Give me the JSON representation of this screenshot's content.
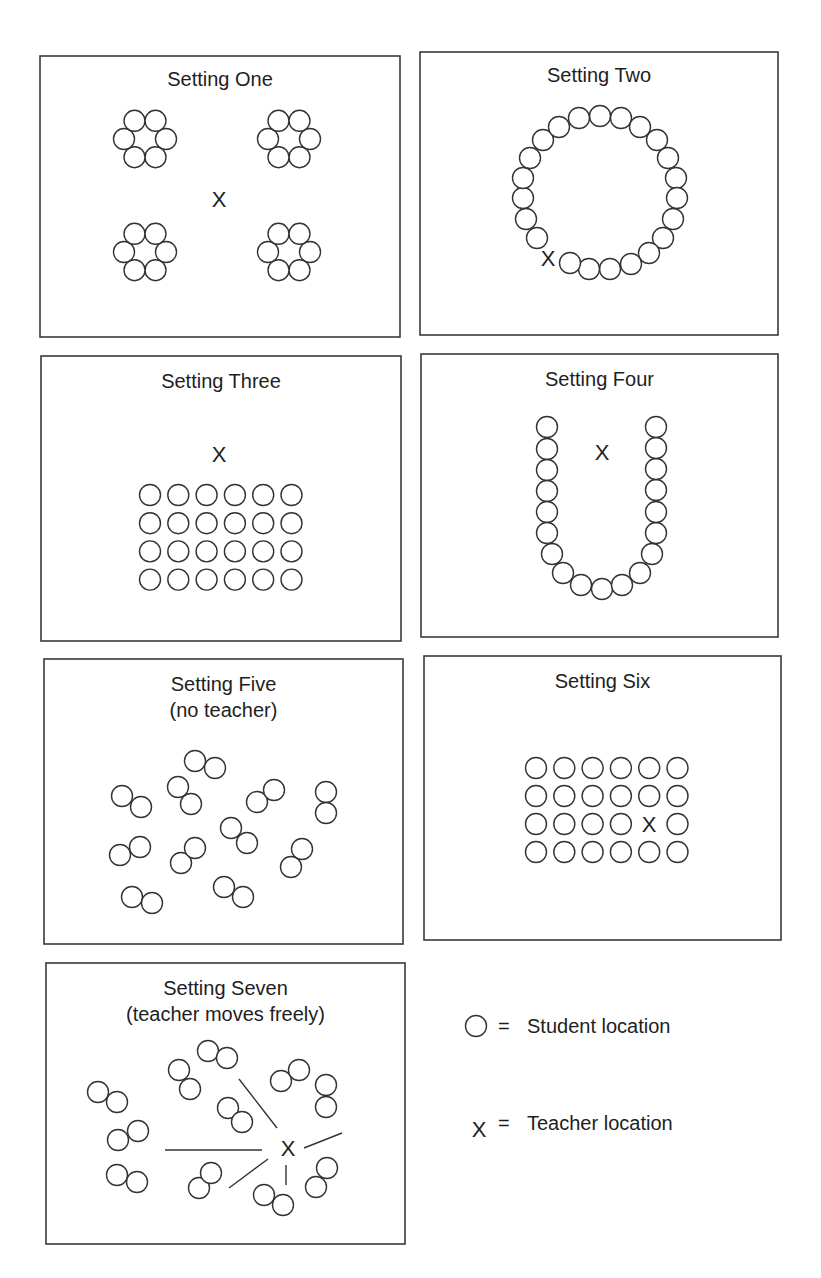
{
  "diagram": {
    "teacher_symbol": "X",
    "colors": {
      "stroke": "#333333",
      "background": "#ffffff",
      "text": "#1e1e1e"
    },
    "student_radius": 10.5,
    "panels": [
      {
        "id": "setting-one",
        "title": [
          "Setting One"
        ],
        "box": [
          40,
          56,
          360,
          281
        ],
        "title_y": [
          86
        ],
        "layout": "four hexagonal clusters of six",
        "clusters": [
          [
            145,
            139
          ],
          [
            289,
            139
          ],
          [
            145,
            252
          ],
          [
            289,
            252
          ]
        ],
        "cluster_offset": 21,
        "students": [],
        "teachers": [
          [
            219,
            199
          ]
        ],
        "rays": []
      },
      {
        "id": "setting-two",
        "title": [
          "Setting Two"
        ],
        "box": [
          420,
          52,
          358,
          283
        ],
        "title_y": [
          82
        ],
        "layout": "circle",
        "students": [
          [
            600,
            116
          ],
          [
            621,
            118
          ],
          [
            640,
            127
          ],
          [
            657,
            140
          ],
          [
            668,
            158
          ],
          [
            676,
            178
          ],
          [
            677,
            198
          ],
          [
            673,
            219
          ],
          [
            663,
            238
          ],
          [
            649,
            253
          ],
          [
            631,
            264
          ],
          [
            610,
            269
          ],
          [
            589,
            269
          ],
          [
            570,
            263
          ],
          [
            537,
            238
          ],
          [
            526,
            219
          ],
          [
            523,
            198
          ],
          [
            523,
            178
          ],
          [
            530,
            158
          ],
          [
            543,
            140
          ],
          [
            559,
            127
          ],
          [
            579,
            118
          ]
        ],
        "teachers": [
          [
            548,
            258
          ]
        ],
        "rays": []
      },
      {
        "id": "setting-three",
        "title": [
          "Setting Three"
        ],
        "box": [
          41,
          356,
          360,
          285
        ],
        "title_y": [
          388
        ],
        "layout": "grid 6x4",
        "grid": {
          "origin": [
            150,
            495
          ],
          "cols": 6,
          "rows": 4,
          "dx": 28.3,
          "dy": 28.2,
          "skip": []
        },
        "students": [],
        "teachers": [
          [
            219,
            454
          ]
        ],
        "rays": []
      },
      {
        "id": "setting-four",
        "title": [
          "Setting Four"
        ],
        "box": [
          421,
          354,
          357,
          283
        ],
        "title_y": [
          386
        ],
        "layout": "U-shape",
        "students": [
          [
            547,
            427
          ],
          [
            547,
            449
          ],
          [
            547,
            470
          ],
          [
            547,
            491
          ],
          [
            547,
            512
          ],
          [
            547,
            533
          ],
          [
            552,
            554
          ],
          [
            563,
            573
          ],
          [
            581,
            585
          ],
          [
            602,
            589
          ],
          [
            622,
            585
          ],
          [
            640,
            573
          ],
          [
            652,
            554
          ],
          [
            656,
            533
          ],
          [
            656,
            512
          ],
          [
            656,
            490
          ],
          [
            656,
            469
          ],
          [
            656,
            448
          ],
          [
            656,
            427
          ]
        ],
        "teachers": [
          [
            602,
            452
          ]
        ],
        "rays": []
      },
      {
        "id": "setting-five",
        "title": [
          "Setting Five",
          "(no teacher)"
        ],
        "box": [
          44,
          659,
          359,
          285
        ],
        "title_y": [
          691,
          717
        ],
        "layout": "scattered pairs",
        "students": [
          [
            195,
            761
          ],
          [
            215,
            768
          ],
          [
            122,
            796
          ],
          [
            141,
            807
          ],
          [
            178,
            787
          ],
          [
            191,
            804
          ],
          [
            257,
            802
          ],
          [
            274,
            790
          ],
          [
            326,
            792
          ],
          [
            326,
            813
          ],
          [
            231,
            828
          ],
          [
            247,
            843
          ],
          [
            120,
            855
          ],
          [
            140,
            847
          ],
          [
            181,
            863
          ],
          [
            195,
            848
          ],
          [
            302,
            849
          ],
          [
            291,
            867
          ],
          [
            132,
            897
          ],
          [
            152,
            903
          ],
          [
            224,
            887
          ],
          [
            243,
            897
          ]
        ],
        "teachers": [],
        "rays": []
      },
      {
        "id": "setting-six",
        "title": [
          "Setting Six"
        ],
        "box": [
          424,
          656,
          357,
          284
        ],
        "title_y": [
          688
        ],
        "layout": "grid 6x4 with teacher inside",
        "grid": {
          "origin": [
            536,
            768
          ],
          "cols": 6,
          "rows": 4,
          "dx": 28.3,
          "dy": 28,
          "skip": [
            [
              2,
              4
            ]
          ]
        },
        "students": [],
        "teachers": [
          [
            649,
            824
          ]
        ],
        "rays": []
      },
      {
        "id": "setting-seven",
        "title": [
          "Setting Seven",
          "(teacher moves freely)"
        ],
        "box": [
          46,
          963,
          359,
          281
        ],
        "title_y": [
          995,
          1021
        ],
        "layout": "scattered pairs with roaming teacher",
        "students": [
          [
            208,
            1051
          ],
          [
            227,
            1058
          ],
          [
            179,
            1070
          ],
          [
            190,
            1089
          ],
          [
            281,
            1081
          ],
          [
            299,
            1070
          ],
          [
            326,
            1085
          ],
          [
            326,
            1107
          ],
          [
            98,
            1092
          ],
          [
            117,
            1102
          ],
          [
            228,
            1108
          ],
          [
            242,
            1122
          ],
          [
            118,
            1140
          ],
          [
            138,
            1131
          ],
          [
            117,
            1175
          ],
          [
            137,
            1182
          ],
          [
            199,
            1188
          ],
          [
            211,
            1173
          ],
          [
            264,
            1195
          ],
          [
            283,
            1205
          ],
          [
            316,
            1187
          ],
          [
            327,
            1168
          ]
        ],
        "teachers": [
          [
            288,
            1148
          ]
        ],
        "rays": [
          [
            239,
            1079,
            277,
            1128
          ],
          [
            165,
            1150,
            262,
            1150
          ],
          [
            229,
            1188,
            268,
            1159
          ],
          [
            286,
            1165,
            286,
            1185
          ],
          [
            304,
            1148,
            342,
            1133
          ]
        ]
      }
    ],
    "legend": [
      {
        "symbol": "student-circle",
        "equals": "=",
        "label": "Student location",
        "x": 476,
        "y": 1026
      },
      {
        "symbol": "teacher-x",
        "equals": "=",
        "label": "Teacher location",
        "x": 479,
        "y": 1129
      }
    ]
  }
}
